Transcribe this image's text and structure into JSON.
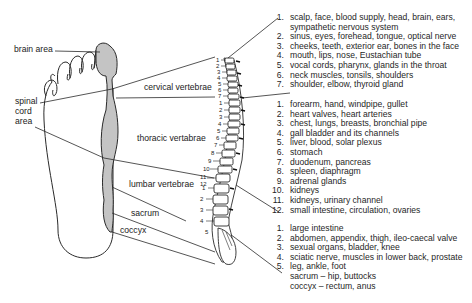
{
  "diagram": {
    "foot_labels": {
      "brain_area": "brain area",
      "spinal_cord_area": [
        "spinal",
        "cord",
        "area"
      ]
    },
    "spine_labels": {
      "cervical": "cervical vertebrae",
      "thoracic": "thoracic vertabrae",
      "lumbar": "lumbar vertebrae",
      "sacrum": "sacrum",
      "coccyx": "coccyx"
    },
    "vertebra_numbers": {
      "cervical": [
        "1",
        "2",
        "3",
        "4",
        "5",
        "6",
        "7"
      ],
      "thoracic": [
        "1",
        "2",
        "3",
        "4",
        "5",
        "6",
        "7",
        "8",
        "9",
        "10",
        "11",
        "12"
      ],
      "lumbar": [
        "1",
        "2",
        "3",
        "4",
        "5"
      ]
    },
    "groups": [
      {
        "name": "cervical",
        "items": [
          {
            "n": "1.",
            "text": "scalp, face, blood supply, head, brain, ears,"
          },
          {
            "n": "",
            "text": "sympathetic  nervous system"
          },
          {
            "n": "2.",
            "text": "sinus, eyes, forehead, tongue, optical nerve"
          },
          {
            "n": "3.",
            "text": "cheeks, teeth, exterior ear, bones in the face"
          },
          {
            "n": "4.",
            "text": "mouth, lips, nose, Eustachian tube"
          },
          {
            "n": "5.",
            "text": "vocal cords, pharynx, glands in the throat"
          },
          {
            "n": "6.",
            "text": "neck muscles, tonsils, shoulders"
          },
          {
            "n": "7.",
            "text": "shoulder, elbow, thyroid gland"
          }
        ]
      },
      {
        "name": "thoracic",
        "items": [
          {
            "n": "1.",
            "text": "forearm, hand, windpipe, gullet"
          },
          {
            "n": "2.",
            "text": "heart valves, heart arteries"
          },
          {
            "n": "3.",
            "text": "chest, lungs, breasts, bronchial pipe"
          },
          {
            "n": "4.",
            "text": "gall bladder and its channels"
          },
          {
            "n": "5.",
            "text": "liver, blood, solar plexus"
          },
          {
            "n": "6.",
            "text": "stomach"
          },
          {
            "n": "7.",
            "text": "duodenum, pancreas"
          },
          {
            "n": "8.",
            "text": "spleen, diaphragm"
          },
          {
            "n": "9.",
            "text": "adrenal glands"
          },
          {
            "n": "10.",
            "text": "kidneys"
          },
          {
            "n": "11.",
            "text": "kidneys, urinary channel"
          },
          {
            "n": "12.",
            "text": "small intestine, circulation, ovaries"
          }
        ]
      },
      {
        "name": "lumbar",
        "items": [
          {
            "n": "1.",
            "text": "large intestine"
          },
          {
            "n": "2.",
            "text": "abdomen, appendix, thigh, ileo-caecal valve"
          },
          {
            "n": "3.",
            "text": "sexual organs, bladder, knee"
          },
          {
            "n": "4.",
            "text": "sciatic nerve, muscles in lower back, prostate"
          },
          {
            "n": "5.",
            "text": "leg, ankle, foot"
          },
          {
            "n": "",
            "text": "sacrum – hip, buttocks"
          },
          {
            "n": "",
            "text": "coccyx – rectum, anus"
          }
        ]
      }
    ],
    "colors": {
      "line": "#2a2a2a",
      "spinal_fill": "#c4c4c4",
      "text": "#1f1f1f"
    }
  }
}
